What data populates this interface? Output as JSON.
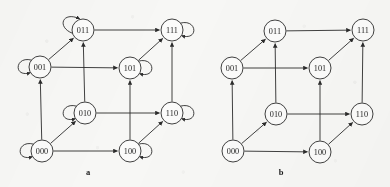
{
  "figure": {
    "type": "state-transition-diagram",
    "background_color": "#f7f7f5",
    "stroke_color": "#2b2b2b",
    "node_fill": "#fbfbfa",
    "node_radius": 11
  },
  "panels": [
    {
      "id": "a",
      "caption": "a",
      "caption_pos": {
        "x": 88,
        "y": 175
      },
      "has_self_loops": true,
      "nodes": [
        {
          "id": "011",
          "label": "011",
          "x": 83,
          "y": 30,
          "loop": "up-left"
        },
        {
          "id": "111",
          "label": "111",
          "x": 172,
          "y": 30,
          "loop": "right"
        },
        {
          "id": "001",
          "label": "001",
          "x": 40,
          "y": 67,
          "loop": "left"
        },
        {
          "id": "101",
          "label": "101",
          "x": 130,
          "y": 68,
          "loop": "right"
        },
        {
          "id": "010",
          "label": "010",
          "x": 85,
          "y": 113,
          "loop": "left"
        },
        {
          "id": "110",
          "label": "110",
          "x": 172,
          "y": 113,
          "loop": "right"
        },
        {
          "id": "000",
          "label": "000",
          "x": 42,
          "y": 151,
          "loop": "left"
        },
        {
          "id": "100",
          "label": "100",
          "x": 130,
          "y": 151,
          "loop": "right"
        }
      ],
      "edges": [
        {
          "from": "000",
          "to": "001"
        },
        {
          "from": "000",
          "to": "010"
        },
        {
          "from": "000",
          "to": "100"
        },
        {
          "from": "001",
          "to": "011"
        },
        {
          "from": "001",
          "to": "101"
        },
        {
          "from": "010",
          "to": "011"
        },
        {
          "from": "010",
          "to": "110"
        },
        {
          "from": "100",
          "to": "101"
        },
        {
          "from": "100",
          "to": "110"
        },
        {
          "from": "011",
          "to": "111"
        },
        {
          "from": "101",
          "to": "111"
        },
        {
          "from": "110",
          "to": "111"
        }
      ],
      "self_loops": [
        "000",
        "001",
        "010",
        "011",
        "100",
        "101",
        "110",
        "111"
      ]
    },
    {
      "id": "b",
      "caption": "b",
      "caption_pos": {
        "x": 281,
        "y": 175
      },
      "has_self_loops": false,
      "nodes": [
        {
          "id": "011",
          "label": "011",
          "x": 275,
          "y": 31,
          "loop": null
        },
        {
          "id": "111",
          "label": "111",
          "x": 363,
          "y": 30,
          "loop": null
        },
        {
          "id": "001",
          "label": "001",
          "x": 232,
          "y": 68,
          "loop": null
        },
        {
          "id": "101",
          "label": "101",
          "x": 320,
          "y": 68,
          "loop": null
        },
        {
          "id": "010",
          "label": "010",
          "x": 276,
          "y": 114,
          "loop": null
        },
        {
          "id": "110",
          "label": "110",
          "x": 362,
          "y": 114,
          "loop": null
        },
        {
          "id": "000",
          "label": "000",
          "x": 233,
          "y": 151,
          "loop": null
        },
        {
          "id": "100",
          "label": "100",
          "x": 320,
          "y": 152,
          "loop": null
        }
      ],
      "edges": [
        {
          "from": "000",
          "to": "001"
        },
        {
          "from": "000",
          "to": "010"
        },
        {
          "from": "000",
          "to": "100"
        },
        {
          "from": "001",
          "to": "011"
        },
        {
          "from": "001",
          "to": "101"
        },
        {
          "from": "010",
          "to": "011"
        },
        {
          "from": "010",
          "to": "110"
        },
        {
          "from": "100",
          "to": "101"
        },
        {
          "from": "100",
          "to": "110"
        },
        {
          "from": "011",
          "to": "111"
        },
        {
          "from": "101",
          "to": "111"
        },
        {
          "from": "110",
          "to": "111"
        }
      ],
      "self_loops": []
    }
  ]
}
